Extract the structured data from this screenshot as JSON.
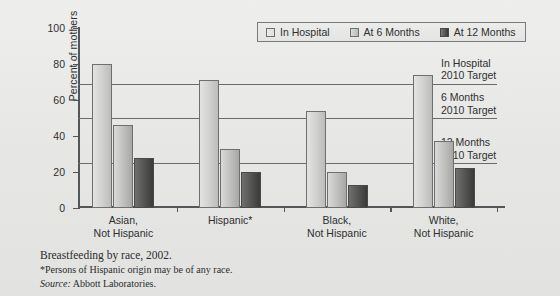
{
  "chart_data": {
    "type": "bar",
    "title": "Breastfeeding by race, 2002.",
    "xlabel": "",
    "ylabel": "Percent of mothers",
    "ylim": [
      0,
      100
    ],
    "yticks": [
      0,
      20,
      40,
      60,
      80,
      100
    ],
    "grid": false,
    "legend_position": "top-center",
    "categories": [
      "Asian, Not Hispanic",
      "Hispanic*",
      "Black, Not Hispanic",
      "White, Not Hispanic"
    ],
    "category_lines": [
      [
        "Asian,",
        "Not Hispanic"
      ],
      [
        "Hispanic*",
        ""
      ],
      [
        "Black,",
        "Not Hispanic"
      ],
      [
        "White,",
        "Not Hispanic"
      ]
    ],
    "series": [
      {
        "name": "In Hospital",
        "values": [
          80,
          71,
          54,
          74
        ]
      },
      {
        "name": "At 6 Months",
        "values": [
          46,
          33,
          20,
          37
        ]
      },
      {
        "name": "At 12 Months",
        "values": [
          28,
          20,
          13,
          22
        ]
      }
    ],
    "reference_lines": [
      {
        "name": "In Hospital 2010 Target",
        "label_lines": [
          "In Hospital",
          "2010 Target"
        ],
        "value": 69
      },
      {
        "name": "6 Months 2010 Target",
        "label_lines": [
          "6 Months",
          "2010 Target"
        ],
        "value": 50
      },
      {
        "name": "12 Months 2010 Target",
        "label_lines": [
          "12 Months",
          "2010 Target"
        ],
        "value": 25
      }
    ],
    "annotations": [
      "*Persons of Hispanic origin may be of any race.",
      "Source: Abbott Laboratories."
    ],
    "colors": {
      "series_in_hospital": "#d2d2d0",
      "series_6_months": "#c2c2c0",
      "series_12_months": "#4a4a48",
      "axis": "#55565a",
      "reference_line": "#6a6b6f",
      "background": "#e8e8e6",
      "text": "#2e2f31"
    }
  },
  "legend": {
    "items": [
      {
        "label": "In Hospital"
      },
      {
        "label": "At 6 Months"
      },
      {
        "label": "At 12 Months"
      }
    ]
  },
  "axis": {
    "y_title": "Percent of mothers",
    "y_labels": [
      "100",
      "80",
      "60",
      "40",
      "20",
      "0"
    ]
  },
  "caption": {
    "title": "Breastfeeding by race, 2002.",
    "note": "*Persons of Hispanic origin may be of any race.",
    "source_lead": "Source:",
    "source_text": "Abbott Laboratories."
  }
}
